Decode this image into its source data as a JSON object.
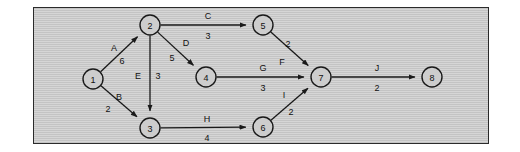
{
  "diagram": {
    "type": "directed-network",
    "background_color": "#c9c9c9",
    "border_color": "#2b2b2b",
    "node_fill": "#cdcdcd",
    "node_stroke": "#1a1a1a",
    "edge_color": "#1a1a1a",
    "node_radius": 10,
    "nodes": [
      {
        "id": "1",
        "label": "1",
        "cx": 59,
        "cy": 71
      },
      {
        "id": "2",
        "label": "2",
        "cx": 116,
        "cy": 17
      },
      {
        "id": "3",
        "label": "3",
        "cx": 116,
        "cy": 120
      },
      {
        "id": "4",
        "label": "4",
        "cx": 172,
        "cy": 69
      },
      {
        "id": "5",
        "label": "5",
        "cx": 229,
        "cy": 17
      },
      {
        "id": "6",
        "label": "6",
        "cx": 229,
        "cy": 119
      },
      {
        "id": "7",
        "label": "7",
        "cx": 287,
        "cy": 69
      },
      {
        "id": "8",
        "label": "8",
        "cx": 398,
        "cy": 69
      }
    ],
    "edges": [
      {
        "id": "A",
        "name": "A",
        "weight": "6",
        "from": "1",
        "to": "2",
        "name_x": 80,
        "name_y": 40,
        "weight_x": 88,
        "weight_y": 53
      },
      {
        "id": "B",
        "name": "B",
        "weight": "2",
        "from": "1",
        "to": "3",
        "name_x": 85,
        "name_y": 89,
        "weight_x": 74,
        "weight_y": 101
      },
      {
        "id": "C",
        "name": "C",
        "weight": "3",
        "from": "2",
        "to": "5",
        "name_x": 174,
        "name_y": 8,
        "weight_x": 174,
        "weight_y": 28
      },
      {
        "id": "D",
        "name": "D",
        "weight": "5",
        "from": "2",
        "to": "4",
        "name_x": 152,
        "name_y": 35,
        "weight_x": 138,
        "weight_y": 50
      },
      {
        "id": "E",
        "name": "E",
        "weight": "3",
        "from": "2",
        "to": "3",
        "name_x": 104,
        "name_y": 68,
        "weight_x": 124,
        "weight_y": 68
      },
      {
        "id": "F",
        "name": "F",
        "weight": "2",
        "from": "5",
        "to": "7",
        "name_x": 248,
        "name_y": 54,
        "weight_x": 254,
        "weight_y": 36
      },
      {
        "id": "G",
        "name": "G",
        "weight": "3",
        "from": "4",
        "to": "7",
        "name_x": 229,
        "name_y": 60,
        "weight_x": 229,
        "weight_y": 80
      },
      {
        "id": "H",
        "name": "H",
        "weight": "4",
        "from": "3",
        "to": "6",
        "name_x": 173,
        "name_y": 111,
        "weight_x": 173,
        "weight_y": 130
      },
      {
        "id": "I",
        "name": "I",
        "weight": "2",
        "from": "6",
        "to": "7",
        "name_x": 250,
        "name_y": 87,
        "weight_x": 257,
        "weight_y": 104
      },
      {
        "id": "J",
        "name": "J",
        "weight": "2",
        "from": "7",
        "to": "8",
        "name_x": 343,
        "name_y": 60,
        "weight_x": 343,
        "weight_y": 80
      }
    ]
  }
}
